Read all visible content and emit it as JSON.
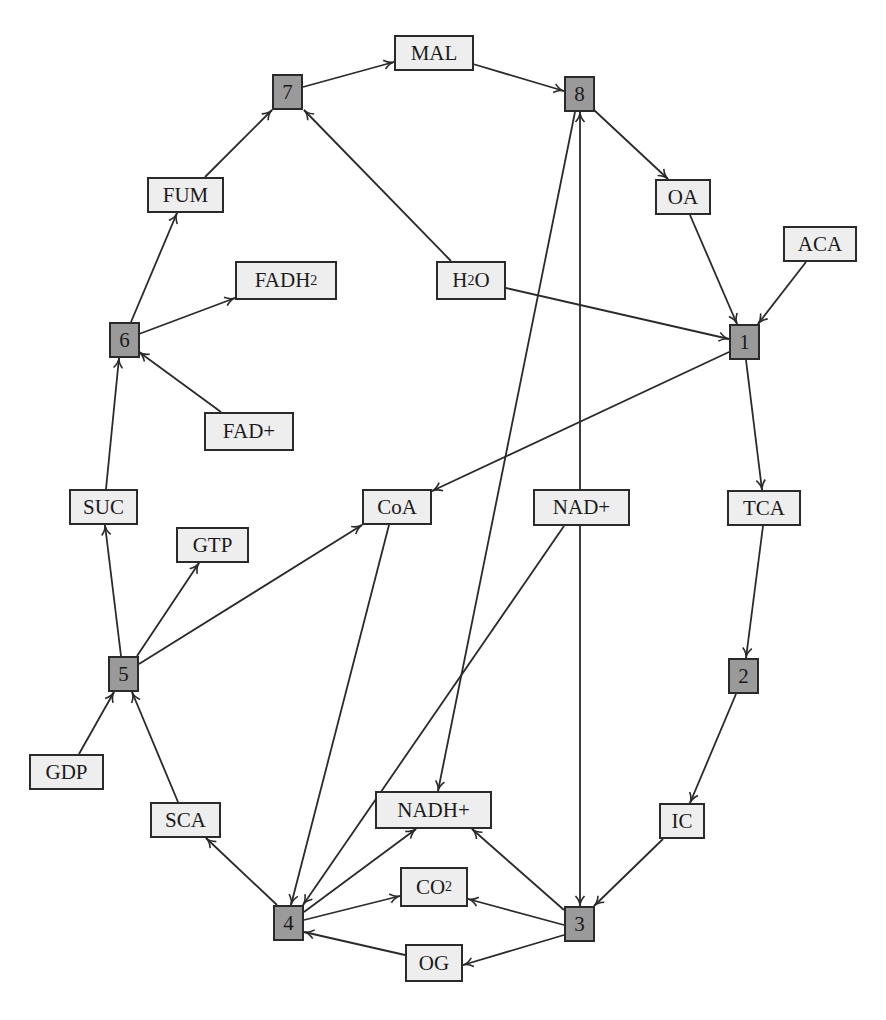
{
  "diagram": {
    "title": "",
    "colors": {
      "reaction_fill": "#9a9a9a",
      "metabolite_fill": "#eeeeee",
      "stroke": "#2a2a2a",
      "background": "#ffffff"
    },
    "nodes": [
      {
        "id": "1",
        "label": "1",
        "type": "reaction",
        "x": 729,
        "y": 324,
        "w": 31,
        "h": 36
      },
      {
        "id": "2",
        "label": "2",
        "type": "reaction",
        "x": 728,
        "y": 658,
        "w": 31,
        "h": 36
      },
      {
        "id": "3",
        "label": "3",
        "type": "reaction",
        "x": 564,
        "y": 906,
        "w": 31,
        "h": 36
      },
      {
        "id": "4",
        "label": "4",
        "type": "reaction",
        "x": 273,
        "y": 905,
        "w": 31,
        "h": 36
      },
      {
        "id": "5",
        "label": "5",
        "type": "reaction",
        "x": 108,
        "y": 656,
        "w": 31,
        "h": 36
      },
      {
        "id": "6",
        "label": "6",
        "type": "reaction",
        "x": 109,
        "y": 322,
        "w": 31,
        "h": 36
      },
      {
        "id": "7",
        "label": "7",
        "type": "reaction",
        "x": 272,
        "y": 74,
        "w": 31,
        "h": 36
      },
      {
        "id": "8",
        "label": "8",
        "type": "reaction",
        "x": 564,
        "y": 76,
        "w": 31,
        "h": 36
      },
      {
        "id": "MAL",
        "label": "MAL",
        "sub": "",
        "type": "metabolite",
        "x": 394,
        "y": 35,
        "w": 80,
        "h": 36
      },
      {
        "id": "OA",
        "label": "OA",
        "sub": "",
        "type": "metabolite",
        "x": 655,
        "y": 179,
        "w": 56,
        "h": 36
      },
      {
        "id": "ACA",
        "label": "ACA",
        "sub": "",
        "type": "metabolite",
        "x": 783,
        "y": 226,
        "w": 74,
        "h": 36
      },
      {
        "id": "FUM",
        "label": "FUM",
        "sub": "",
        "type": "metabolite",
        "x": 147,
        "y": 177,
        "w": 77,
        "h": 36
      },
      {
        "id": "FADH2",
        "label": "FADH",
        "sub": "2",
        "type": "metabolite",
        "x": 235,
        "y": 261,
        "w": 102,
        "h": 39
      },
      {
        "id": "H2O",
        "label": "H",
        "sub": "2",
        "tail": "O",
        "type": "metabolite",
        "x": 436,
        "y": 261,
        "w": 70,
        "h": 39
      },
      {
        "id": "FAD+",
        "label": "FAD+",
        "sub": "",
        "type": "metabolite",
        "x": 204,
        "y": 412,
        "w": 90,
        "h": 39
      },
      {
        "id": "SUC",
        "label": "SUC",
        "sub": "",
        "type": "metabolite",
        "x": 69,
        "y": 489,
        "w": 69,
        "h": 36
      },
      {
        "id": "CoA",
        "label": "CoA",
        "sub": "",
        "type": "metabolite",
        "x": 362,
        "y": 489,
        "w": 70,
        "h": 36
      },
      {
        "id": "NAD+",
        "label": "NAD+",
        "sub": "",
        "type": "metabolite",
        "x": 533,
        "y": 489,
        "w": 97,
        "h": 37
      },
      {
        "id": "TCA",
        "label": "TCA",
        "sub": "",
        "type": "metabolite",
        "x": 727,
        "y": 490,
        "w": 74,
        "h": 36
      },
      {
        "id": "GTP",
        "label": "GTP",
        "sub": "",
        "type": "metabolite",
        "x": 176,
        "y": 527,
        "w": 73,
        "h": 36
      },
      {
        "id": "GDP",
        "label": "GDP",
        "sub": "",
        "type": "metabolite",
        "x": 29,
        "y": 754,
        "w": 75,
        "h": 36
      },
      {
        "id": "SCA",
        "label": "SCA",
        "sub": "",
        "type": "metabolite",
        "x": 150,
        "y": 802,
        "w": 71,
        "h": 36
      },
      {
        "id": "NADH+",
        "label": "NADH+",
        "sub": "",
        "type": "metabolite",
        "x": 375,
        "y": 791,
        "w": 117,
        "h": 38
      },
      {
        "id": "IC",
        "label": "IC",
        "sub": "",
        "type": "metabolite",
        "x": 659,
        "y": 803,
        "w": 46,
        "h": 36
      },
      {
        "id": "CO2",
        "label": "CO",
        "sub": "2",
        "type": "metabolite",
        "x": 400,
        "y": 867,
        "w": 68,
        "h": 40
      },
      {
        "id": "OG",
        "label": "OG",
        "sub": "",
        "type": "metabolite",
        "x": 405,
        "y": 944,
        "w": 58,
        "h": 38
      }
    ],
    "edges": [
      {
        "from": "7",
        "to": "MAL",
        "x1": 303,
        "y1": 87,
        "x2": 394,
        "y2": 62
      },
      {
        "from": "MAL",
        "to": "8",
        "x1": 473,
        "y1": 64,
        "x2": 564,
        "y2": 91
      },
      {
        "from": "8",
        "to": "OA",
        "x1": 594,
        "y1": 110,
        "x2": 668,
        "y2": 179
      },
      {
        "from": "OA",
        "to": "1",
        "x1": 690,
        "y1": 215,
        "x2": 737,
        "y2": 324
      },
      {
        "from": "ACA",
        "to": "1",
        "x1": 806,
        "y1": 262,
        "x2": 758,
        "y2": 324
      },
      {
        "from": "H2O",
        "to": "1",
        "x1": 506,
        "y1": 288,
        "x2": 729,
        "y2": 339
      },
      {
        "from": "1",
        "to": "CoA",
        "x1": 729,
        "y1": 352,
        "x2": 432,
        "y2": 491
      },
      {
        "from": "1",
        "to": "TCA",
        "x1": 746,
        "y1": 360,
        "x2": 762,
        "y2": 490
      },
      {
        "from": "TCA",
        "to": "2",
        "x1": 763,
        "y1": 526,
        "x2": 746,
        "y2": 658
      },
      {
        "from": "2",
        "to": "IC",
        "x1": 736,
        "y1": 694,
        "x2": 690,
        "y2": 803
      },
      {
        "from": "IC",
        "to": "3",
        "x1": 663,
        "y1": 839,
        "x2": 594,
        "y2": 906
      },
      {
        "from": "8",
        "to": "3",
        "bidirectional": true,
        "x1": 580,
        "y1": 112,
        "x2": 580,
        "y2": 906
      },
      {
        "from": "8",
        "to": "NADH+",
        "x1": 575,
        "y1": 112,
        "x2": 438,
        "y2": 791
      },
      {
        "from": "3",
        "to": "NADH+",
        "x1": 564,
        "y1": 910,
        "x2": 472,
        "y2": 829
      },
      {
        "from": "3",
        "to": "CO2",
        "x1": 564,
        "y1": 925,
        "x2": 468,
        "y2": 899
      },
      {
        "from": "3",
        "to": "OG",
        "x1": 564,
        "y1": 935,
        "x2": 463,
        "y2": 965
      },
      {
        "from": "OG",
        "to": "4",
        "x1": 405,
        "y1": 955,
        "x2": 304,
        "y2": 932
      },
      {
        "from": "4",
        "to": "CO2",
        "x1": 304,
        "y1": 920,
        "x2": 400,
        "y2": 896
      },
      {
        "from": "4",
        "to": "NADH+",
        "x1": 304,
        "y1": 912,
        "x2": 416,
        "y2": 829
      },
      {
        "from": "CoA",
        "to": "4",
        "x1": 389,
        "y1": 525,
        "x2": 291,
        "y2": 905
      },
      {
        "from": "NAD+",
        "to": "4",
        "x1": 564,
        "y1": 526,
        "x2": 303,
        "y2": 905
      },
      {
        "from": "4",
        "to": "SCA",
        "x1": 277,
        "y1": 905,
        "x2": 206,
        "y2": 838
      },
      {
        "from": "SCA",
        "to": "5",
        "x1": 178,
        "y1": 802,
        "x2": 132,
        "y2": 692
      },
      {
        "from": "GDP",
        "to": "5",
        "x1": 79,
        "y1": 754,
        "x2": 114,
        "y2": 692
      },
      {
        "from": "5",
        "to": "SUC",
        "x1": 121,
        "y1": 656,
        "x2": 105,
        "y2": 525
      },
      {
        "from": "5",
        "to": "GTP",
        "x1": 137,
        "y1": 656,
        "x2": 199,
        "y2": 563
      },
      {
        "from": "5",
        "to": "CoA",
        "x1": 139,
        "y1": 664,
        "x2": 362,
        "y2": 525
      },
      {
        "from": "SUC",
        "to": "6",
        "x1": 106,
        "y1": 489,
        "x2": 119,
        "y2": 358
      },
      {
        "from": "FAD+",
        "to": "6",
        "x1": 221,
        "y1": 412,
        "x2": 139,
        "y2": 352
      },
      {
        "from": "6",
        "to": "FADH2",
        "x1": 139,
        "y1": 334,
        "x2": 235,
        "y2": 298
      },
      {
        "from": "6",
        "to": "FUM",
        "x1": 131,
        "y1": 322,
        "x2": 177,
        "y2": 213
      },
      {
        "from": "FUM",
        "to": "7",
        "x1": 205,
        "y1": 177,
        "x2": 272,
        "y2": 110
      },
      {
        "from": "H2O",
        "to": "7",
        "x1": 451,
        "y1": 261,
        "x2": 304,
        "y2": 110
      }
    ]
  }
}
